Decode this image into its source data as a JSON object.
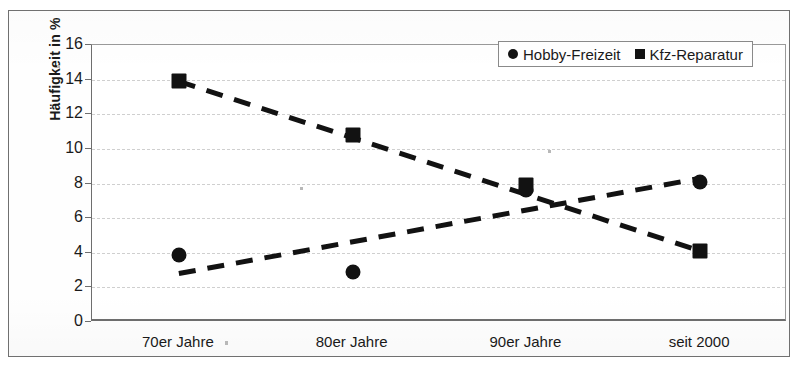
{
  "chart_data": {
    "type": "scatter",
    "title": "",
    "subtitle": "",
    "xlabel": "",
    "ylabel": "Häufigkeit in %",
    "categories": [
      "70er Jahre",
      "80er Jahre",
      "90er Jahre",
      "seit 2000"
    ],
    "ylim": [
      0,
      16
    ],
    "yticks": [
      0,
      2,
      4,
      6,
      8,
      10,
      12,
      14,
      16
    ],
    "grid": "horizontal-dashed",
    "legend_position": "top-right",
    "series": [
      {
        "name": "Hobby-Freizeit",
        "marker": "circle",
        "line_style": "dashed",
        "color": "#121212",
        "values": [
          3.85,
          2.9,
          7.6,
          8.1
        ],
        "trend_endpoints": [
          2.8,
          8.3
        ]
      },
      {
        "name": "Kfz-Reparatur",
        "marker": "square",
        "line_style": "dashed",
        "color": "#121212",
        "values": [
          13.9,
          10.8,
          7.9,
          4.1
        ],
        "trend_endpoints": [
          13.9,
          4.1
        ]
      }
    ]
  },
  "legend": {
    "entries": [
      {
        "label": "Hobby-Freizeit",
        "marker": "circle-marker"
      },
      {
        "label": "Kfz-Reparatur",
        "marker": "square-marker"
      }
    ]
  },
  "axes": {
    "y_title": "Häufigkeit in %",
    "y_tick_labels": [
      "16",
      "14",
      "12",
      "10",
      "8",
      "6",
      "4",
      "2",
      "0"
    ],
    "x_tick_labels": [
      "70er Jahre",
      "80er Jahre",
      "90er Jahre",
      "seit 2000"
    ]
  },
  "colors": {
    "data": "#121212",
    "gridline": "#cfcfcf",
    "axis": "#6e6e6e",
    "frame": "#707070",
    "background": "#ffffff"
  }
}
